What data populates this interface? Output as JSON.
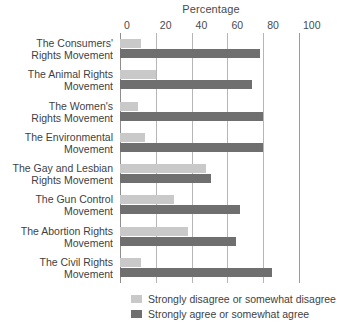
{
  "chart_data": {
    "type": "bar",
    "orientation": "horizontal",
    "title": "Percentage",
    "xlabel": "",
    "ylabel": "",
    "xlim": [
      0,
      100
    ],
    "xticks": [
      0,
      20,
      40,
      60,
      80,
      100
    ],
    "xtick_labels": [
      "0",
      "20",
      "40",
      "60",
      "80",
      "100"
    ],
    "grid": true,
    "legend_position": "bottom",
    "categories": [
      "The Consumers'\nRights Movement",
      "The Animal Rights\nMovement",
      "The Women's\nRights Movement",
      "The Environmental\nMovement",
      "The Gay and Lesbian\nRights Movement",
      "The Gun Control\nMovement",
      "The Abortion Rights\nMovement",
      "The Civil Rights\nMovement"
    ],
    "series": [
      {
        "name": "Strongly disagree or somewhat disagree",
        "color": "#c9c9c9",
        "values": [
          12,
          20,
          10,
          14,
          48,
          30,
          38,
          12
        ]
      },
      {
        "name": "Strongly agree or somewhat agree",
        "color": "#6f6f6f",
        "values": [
          78,
          74,
          80,
          80,
          51,
          67,
          65,
          85
        ]
      }
    ]
  },
  "legend": {
    "items": [
      {
        "label": "Strongly disagree or somewhat disagree",
        "swatch": "light"
      },
      {
        "label": "Strongly agree or somewhat agree",
        "swatch": "dark"
      }
    ]
  }
}
